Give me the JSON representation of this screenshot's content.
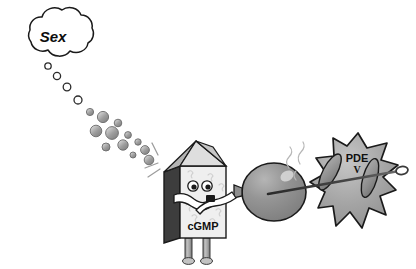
{
  "figure": {
    "background_color": "#ffffff",
    "width": 416,
    "height": 269
  },
  "thought_bubble": {
    "label": "Sex",
    "shape": "cloud",
    "fill_color": "#ffffff",
    "stroke_color": "#1a1a1a",
    "center": {
      "x": 53,
      "y": 36
    },
    "radius_x": 40,
    "radius_y": 26
  },
  "bubble_trail": {
    "description": "chain of thought bubbles from cloud to character head",
    "outline_color": "#2b2b2b",
    "fill_light": "#ffffff",
    "fill_gray": "#9a9a9a",
    "bubbles": [
      {
        "x": 48,
        "y": 66,
        "r": 3.2,
        "style": "outline"
      },
      {
        "x": 57,
        "y": 76,
        "r": 3.6,
        "style": "outline"
      },
      {
        "x": 67,
        "y": 87,
        "r": 3.8,
        "style": "outline"
      },
      {
        "x": 78,
        "y": 100,
        "r": 4.0,
        "style": "outline"
      },
      {
        "x": 90,
        "y": 112,
        "r": 3.6,
        "style": "gray"
      },
      {
        "x": 103,
        "y": 117,
        "r": 5.6,
        "style": "gray"
      },
      {
        "x": 118,
        "y": 123,
        "r": 3.8,
        "style": "gray"
      },
      {
        "x": 96,
        "y": 131,
        "r": 5.8,
        "style": "gray"
      },
      {
        "x": 112,
        "y": 133,
        "r": 6.4,
        "style": "gray"
      },
      {
        "x": 128,
        "y": 135,
        "r": 3.4,
        "style": "gray"
      },
      {
        "x": 106,
        "y": 147,
        "r": 4.0,
        "style": "gray"
      },
      {
        "x": 123,
        "y": 145,
        "r": 5.2,
        "style": "gray"
      },
      {
        "x": 138,
        "y": 142,
        "r": 3.2,
        "style": "gray"
      },
      {
        "x": 145,
        "y": 150,
        "r": 4.4,
        "style": "gray"
      },
      {
        "x": 133,
        "y": 155,
        "r": 3.0,
        "style": "gray"
      },
      {
        "x": 149,
        "y": 160,
        "r": 4.8,
        "style": "gray"
      }
    ]
  },
  "character": {
    "name": "cGMP",
    "label": "cGMP",
    "body_face_color": "#efefef",
    "body_side_color": "#3d3d3d",
    "body_top_color": "#c9c9c9",
    "outline_color": "#1a1a1a",
    "leg_color": "#b3b3b3",
    "eye_count": 2,
    "expression": "blowing",
    "position": {
      "x": 163,
      "y": 140,
      "width": 70,
      "height": 120
    }
  },
  "balloon": {
    "name": "balloon",
    "fill_color": "#8e8e8e",
    "outline_color": "#1a1a1a",
    "highlight_color": "#d6d6d6",
    "center": {
      "x": 274,
      "y": 192
    },
    "radius_x": 32,
    "radius_y": 29,
    "state": "inflated"
  },
  "enzyme": {
    "name": "PDE",
    "label": "PDE",
    "subscript": "V",
    "shape": "star-blob",
    "fill_color": "#a6a6a6",
    "outline_color": "#1a1a1a",
    "arm_color": "#8a8a8a",
    "position": {
      "x": 318,
      "y": 132,
      "width": 82,
      "height": 100
    }
  },
  "needle": {
    "name": "needle",
    "shaft_color": "#2a2a2a",
    "eye_color": "#555555",
    "tip": {
      "x": 268,
      "y": 194
    },
    "eye": {
      "x": 404,
      "y": 171
    },
    "direction": "pointing left toward balloon"
  },
  "motion_marks": {
    "head_lines": 3,
    "balloon_squiggles": 2,
    "color": "#9b9b9b"
  }
}
